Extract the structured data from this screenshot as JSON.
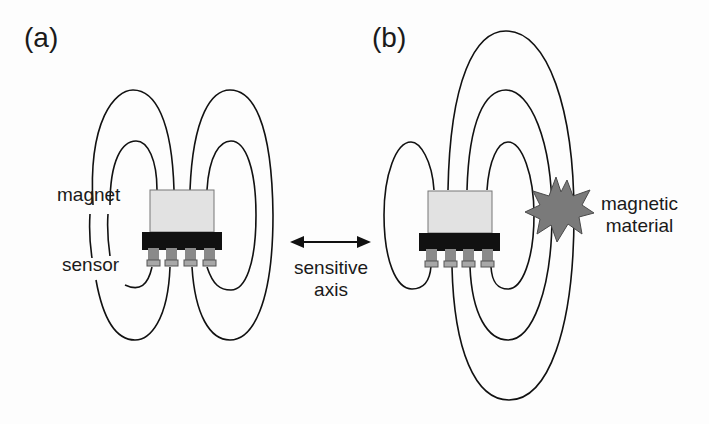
{
  "figure": {
    "panels": [
      {
        "id": "a",
        "label": "(a)",
        "labels": {
          "magnet": "magnet",
          "sensor": "sensor"
        }
      },
      {
        "id": "b",
        "label": "(b)",
        "labels": {
          "material_line1": "magnetic",
          "material_line2": "material"
        }
      }
    ],
    "axis": {
      "line1": "sensitive",
      "line2": "axis"
    },
    "colors": {
      "field_line": "#111111",
      "magnet_fill": "#e2e2e2",
      "sensor_body": "#111111",
      "pin_fill": "#8a8a8a",
      "pin_cap": "#a8a8a8",
      "material_fill": "#7a7a7a"
    }
  }
}
